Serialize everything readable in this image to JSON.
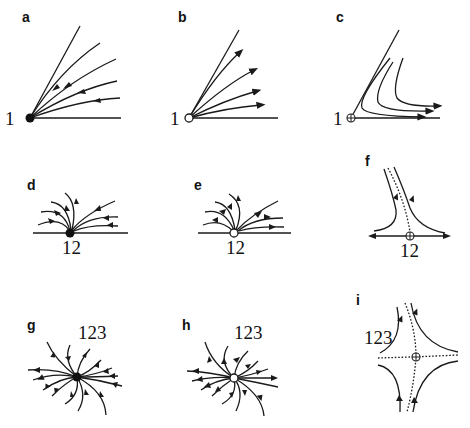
{
  "figure": {
    "panels": [
      {
        "id": "a",
        "label": "a",
        "point_label": "1",
        "point_type": "stable-node (filled)",
        "flow": "inward"
      },
      {
        "id": "b",
        "label": "b",
        "point_label": "1",
        "point_type": "unstable-node (open)",
        "flow": "outward"
      },
      {
        "id": "c",
        "label": "c",
        "point_label": "1",
        "point_type": "saddle (crossed circle)",
        "flow": "passing"
      },
      {
        "id": "d",
        "label": "d",
        "point_label": "12",
        "point_type": "stable-node (filled)",
        "flow": "inward"
      },
      {
        "id": "e",
        "label": "e",
        "point_label": "12",
        "point_type": "unstable-node (open)",
        "flow": "outward"
      },
      {
        "id": "f",
        "label": "f",
        "point_label": "12",
        "point_type": "saddle (crossed circle)",
        "flow": "separatrix"
      },
      {
        "id": "g",
        "label": "g",
        "point_label": "123",
        "point_type": "stable-node (filled)",
        "flow": "inward"
      },
      {
        "id": "h",
        "label": "h",
        "point_label": "123",
        "point_type": "unstable-node (open)",
        "flow": "outward"
      },
      {
        "id": "i",
        "label": "i",
        "point_label": "123",
        "point_type": "saddle (crossed circle)",
        "flow": "separatrix"
      }
    ],
    "colors": {
      "ink": "#1a1a1a",
      "background": "#ffffff"
    }
  }
}
